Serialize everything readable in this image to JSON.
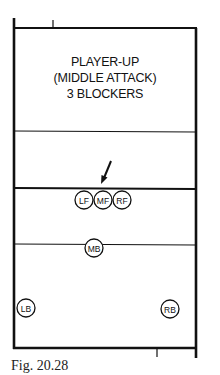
{
  "diagram": {
    "title_lines": [
      "PLAYER-UP",
      "(MIDDLE ATTACK)",
      "3 BLOCKERS"
    ],
    "caption": "Fig. 20.28",
    "players": {
      "LF": "LF",
      "MF": "MF",
      "RF": "RF",
      "MB": "MB",
      "LB": "LB",
      "RB": "RB"
    },
    "arrow": "attack-arrow"
  }
}
